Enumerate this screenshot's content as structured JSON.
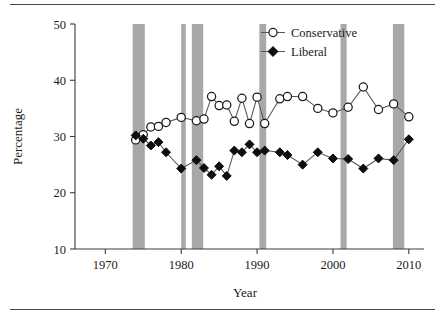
{
  "chart_data": {
    "type": "line",
    "title": "",
    "xlabel": "Year",
    "ylabel": "Percentage",
    "xlim": [
      1966,
      2012
    ],
    "ylim": [
      10,
      50
    ],
    "xticks": [
      1970,
      1980,
      1990,
      2000,
      2010
    ],
    "yticks": [
      10,
      20,
      30,
      40,
      50
    ],
    "grid": false,
    "legend_position": "top-right",
    "legend": [
      "Conservative",
      "Liberal"
    ],
    "annotations": [
      "Shaded vertical bands mark recession periods"
    ],
    "shaded_bands": [
      {
        "start": 1973.6,
        "end": 1975.2
      },
      {
        "start": 1980.0,
        "end": 1980.6
      },
      {
        "start": 1981.4,
        "end": 1982.9
      },
      {
        "start": 1990.3,
        "end": 1991.2
      },
      {
        "start": 2001.0,
        "end": 2001.8
      },
      {
        "start": 2007.9,
        "end": 2009.4
      }
    ],
    "x": [
      1974,
      1975,
      1976,
      1977,
      1978,
      1980,
      1982,
      1983,
      1984,
      1985,
      1986,
      1987,
      1988,
      1989,
      1990,
      1991,
      1993,
      1994,
      1996,
      1998,
      2000,
      2002,
      2004,
      2006,
      2008,
      2010
    ],
    "series": [
      {
        "name": "Conservative",
        "marker": "open-circle",
        "color": "#ffffff",
        "values": [
          29.4,
          30.3,
          31.7,
          31.8,
          32.5,
          33.4,
          32.8,
          33.1,
          37.1,
          35.5,
          35.6,
          32.7,
          36.8,
          32.3,
          37.0,
          32.3,
          36.7,
          37.1,
          37.1,
          35.0,
          34.2,
          35.2,
          38.8,
          34.8,
          35.8,
          33.5
        ]
      },
      {
        "name": "Liberal",
        "marker": "solid-diamond",
        "color": "#0d0d0d",
        "values": [
          30.2,
          29.6,
          28.4,
          29.0,
          27.2,
          24.3,
          25.8,
          24.4,
          23.2,
          24.7,
          23.0,
          27.5,
          27.2,
          28.6,
          27.2,
          27.5,
          27.2,
          26.7,
          25.0,
          27.2,
          26.1,
          26.0,
          24.3,
          26.1,
          25.8,
          29.5
        ]
      }
    ]
  },
  "axis": {
    "y_tick_labels": [
      "50",
      "40",
      "30",
      "20",
      "10"
    ],
    "x_tick_labels": [
      "1970",
      "1980",
      "1990",
      "2000",
      "2010"
    ],
    "y_title": "Percentage",
    "x_title": "Year"
  },
  "legend": {
    "items": [
      {
        "label": "Conservative",
        "marker": "open-circle"
      },
      {
        "label": "Liberal",
        "marker": "solid-diamond"
      }
    ]
  }
}
